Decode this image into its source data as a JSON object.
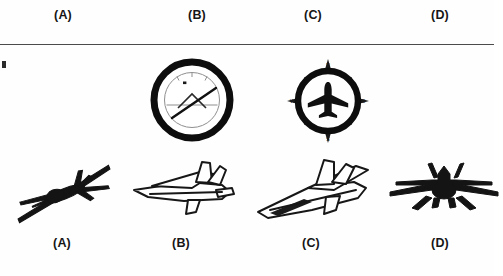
{
  "page": {
    "background_color": "#ffffff",
    "ink_color": "#161616",
    "divider_color": "#4b4b4b",
    "kind": "multiple-choice-figure"
  },
  "top_options": [
    {
      "label": "(A)",
      "x": 63
    },
    {
      "label": "(B)",
      "x": 197
    },
    {
      "label": "(C)",
      "x": 313
    },
    {
      "label": "(D)",
      "x": 440
    }
  ],
  "bottom_options": [
    {
      "label": "(A)",
      "x": 62
    },
    {
      "label": "(B)",
      "x": 181
    },
    {
      "label": "(C)",
      "x": 311
    },
    {
      "label": "(D)",
      "x": 440
    }
  ],
  "stimuli": [
    {
      "name": "attitude-indicator",
      "icon": "attitude-indicator-gauge",
      "x": 142,
      "description": "round aviation gauge with thick black bezel, horizon line and needle"
    },
    {
      "name": "compass-rose",
      "icon": "compass-rose-with-aircraft",
      "x": 278,
      "description": "compass ring with cardinal points and black aircraft silhouette",
      "cardinals": {
        "north": "N",
        "east": "E",
        "south": "S",
        "west": "W"
      }
    }
  ],
  "aircraft": [
    {
      "name": "aircraft-a",
      "label": "(A)",
      "x": 6,
      "style": "filled",
      "description": "dark jet silhouette banking diagonally, nose toward lower-left"
    },
    {
      "name": "aircraft-b",
      "label": "(B)",
      "x": 126,
      "style": "outline",
      "description": "line-art jet outline, nose toward left, tail fins to the right"
    },
    {
      "name": "aircraft-c",
      "label": "(C)",
      "x": 254,
      "style": "outline",
      "description": "line-art jet outline climbing, nose toward lower-left"
    },
    {
      "name": "aircraft-d",
      "label": "(D)",
      "x": 382,
      "style": "filled",
      "description": "dark jet silhouette seen from front, wings spread horizontally"
    }
  ]
}
